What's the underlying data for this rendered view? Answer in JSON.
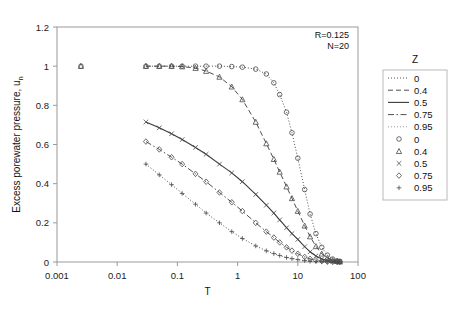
{
  "chart_data": {
    "type": "line",
    "title": "",
    "xlabel": "T",
    "ylabel": "Excess porewater pressure, u",
    "ylabel_sub": "n",
    "xscale": "log",
    "xlim": [
      0.001,
      100
    ],
    "ylim": [
      0,
      1.2
    ],
    "xticks": [
      "0.001",
      "0.01",
      "0.1",
      "1",
      "10",
      "100"
    ],
    "xtick_values": [
      0.001,
      0.01,
      0.1,
      1,
      10,
      100
    ],
    "yticks": [
      "0",
      "0.2",
      "0.4",
      "0.6",
      "0.8",
      "1",
      "1.2"
    ],
    "ytick_values": [
      0,
      0.2,
      0.4,
      0.6,
      0.8,
      1.0,
      1.2
    ],
    "grid": false,
    "legend_position": "right",
    "legend_title": "Z",
    "annotations": [
      "R=0.125",
      "N=20"
    ],
    "series": [
      {
        "name": "0",
        "z": 0,
        "linestyle": "dotted",
        "marker": "circle",
        "color": "#3a3a3a",
        "points": [
          [
            0.0025,
            1.0
          ],
          [
            0.03,
            1.0
          ],
          [
            0.05,
            1.0
          ],
          [
            0.08,
            1.0
          ],
          [
            0.12,
            1.0
          ],
          [
            0.2,
            1.0
          ],
          [
            0.3,
            1.0
          ],
          [
            0.5,
            1.0
          ],
          [
            0.8,
            0.998
          ],
          [
            1.2,
            0.995
          ],
          [
            2.0,
            0.985
          ],
          [
            3.0,
            0.96
          ],
          [
            4.0,
            0.915
          ],
          [
            5.0,
            0.855
          ],
          [
            6.5,
            0.765
          ],
          [
            8.0,
            0.66
          ],
          [
            10.0,
            0.53
          ],
          [
            13.0,
            0.37
          ],
          [
            16.0,
            0.245
          ],
          [
            20.0,
            0.145
          ],
          [
            25.0,
            0.075
          ],
          [
            31.0,
            0.035
          ],
          [
            38.0,
            0.015
          ],
          [
            45.0,
            0.006
          ],
          [
            50.0,
            0.003
          ]
        ]
      },
      {
        "name": "0.4",
        "z": 0.4,
        "linestyle": "dashed",
        "marker": "triangle",
        "color": "#3a3a3a",
        "points": [
          [
            0.0025,
            1.0
          ],
          [
            0.03,
            1.0
          ],
          [
            0.05,
            1.0
          ],
          [
            0.08,
            1.0
          ],
          [
            0.12,
            0.998
          ],
          [
            0.2,
            0.99
          ],
          [
            0.3,
            0.975
          ],
          [
            0.5,
            0.945
          ],
          [
            0.8,
            0.895
          ],
          [
            1.2,
            0.83
          ],
          [
            2.0,
            0.715
          ],
          [
            3.0,
            0.605
          ],
          [
            4.0,
            0.525
          ],
          [
            5.0,
            0.46
          ],
          [
            6.5,
            0.385
          ],
          [
            8.0,
            0.325
          ],
          [
            10.0,
            0.26
          ],
          [
            13.0,
            0.185
          ],
          [
            16.0,
            0.13
          ],
          [
            20.0,
            0.08
          ],
          [
            25.0,
            0.042
          ],
          [
            31.0,
            0.02
          ],
          [
            38.0,
            0.009
          ],
          [
            45.0,
            0.004
          ],
          [
            50.0,
            0.002
          ]
        ]
      },
      {
        "name": "0.5",
        "z": 0.5,
        "linestyle": "solid",
        "marker": "x",
        "color": "#3a3a3a",
        "points": [
          [
            0.03,
            0.715
          ],
          [
            0.05,
            0.685
          ],
          [
            0.08,
            0.655
          ],
          [
            0.12,
            0.625
          ],
          [
            0.2,
            0.585
          ],
          [
            0.3,
            0.55
          ],
          [
            0.5,
            0.5
          ],
          [
            0.8,
            0.455
          ],
          [
            1.2,
            0.41
          ],
          [
            2.0,
            0.345
          ],
          [
            3.0,
            0.29
          ],
          [
            4.0,
            0.25
          ],
          [
            5.0,
            0.215
          ],
          [
            6.5,
            0.175
          ],
          [
            8.0,
            0.145
          ],
          [
            10.0,
            0.115
          ],
          [
            13.0,
            0.078
          ],
          [
            16.0,
            0.052
          ],
          [
            20.0,
            0.031
          ],
          [
            25.0,
            0.016
          ],
          [
            31.0,
            0.008
          ],
          [
            38.0,
            0.004
          ],
          [
            45.0,
            0.002
          ],
          [
            50.0,
            0.001
          ]
        ]
      },
      {
        "name": "0.75",
        "z": 0.75,
        "linestyle": "dashdot",
        "marker": "diamond",
        "color": "#3a3a3a",
        "points": [
          [
            0.03,
            0.615
          ],
          [
            0.05,
            0.575
          ],
          [
            0.08,
            0.535
          ],
          [
            0.12,
            0.5
          ],
          [
            0.2,
            0.45
          ],
          [
            0.3,
            0.41
          ],
          [
            0.5,
            0.355
          ],
          [
            0.8,
            0.305
          ],
          [
            1.2,
            0.26
          ],
          [
            2.0,
            0.2
          ],
          [
            3.0,
            0.155
          ],
          [
            4.0,
            0.125
          ],
          [
            5.0,
            0.1
          ],
          [
            6.5,
            0.075
          ],
          [
            8.0,
            0.058
          ],
          [
            10.0,
            0.042
          ],
          [
            13.0,
            0.026
          ],
          [
            16.0,
            0.016
          ],
          [
            20.0,
            0.009
          ],
          [
            25.0,
            0.005
          ],
          [
            31.0,
            0.002
          ],
          [
            38.0,
            0.001
          ],
          [
            45.0,
            0.0005
          ],
          [
            50.0,
            0.0003
          ]
        ]
      },
      {
        "name": "0.95",
        "z": 0.95,
        "linestyle": "dotted-light",
        "marker": "plus",
        "color": "#8e8e8e",
        "points": [
          [
            0.03,
            0.5
          ],
          [
            0.05,
            0.445
          ],
          [
            0.08,
            0.395
          ],
          [
            0.12,
            0.35
          ],
          [
            0.2,
            0.295
          ],
          [
            0.3,
            0.25
          ],
          [
            0.5,
            0.2
          ],
          [
            0.8,
            0.155
          ],
          [
            1.2,
            0.12
          ],
          [
            2.0,
            0.082
          ],
          [
            3.0,
            0.057
          ],
          [
            4.0,
            0.043
          ],
          [
            5.0,
            0.033
          ],
          [
            6.5,
            0.023
          ],
          [
            8.0,
            0.017
          ],
          [
            10.0,
            0.012
          ],
          [
            13.0,
            0.007
          ],
          [
            16.0,
            0.004
          ],
          [
            20.0,
            0.002
          ],
          [
            25.0,
            0.001
          ],
          [
            31.0,
            0.0006
          ],
          [
            38.0,
            0.0003
          ],
          [
            45.0,
            0.0002
          ],
          [
            50.0,
            0.0001
          ]
        ]
      }
    ],
    "legend_line_entries": [
      {
        "label": "0",
        "linestyle": "dotted"
      },
      {
        "label": "0.4",
        "linestyle": "dashed"
      },
      {
        "label": "0.5",
        "linestyle": "solid"
      },
      {
        "label": "0.75",
        "linestyle": "dashdot"
      },
      {
        "label": "0.95",
        "linestyle": "dotted-light"
      }
    ],
    "legend_marker_entries": [
      {
        "label": "0",
        "marker": "circle"
      },
      {
        "label": "0.4",
        "marker": "triangle"
      },
      {
        "label": "0.5",
        "marker": "x"
      },
      {
        "label": "0.75",
        "marker": "diamond"
      },
      {
        "label": "0.95",
        "marker": "plus"
      }
    ]
  }
}
